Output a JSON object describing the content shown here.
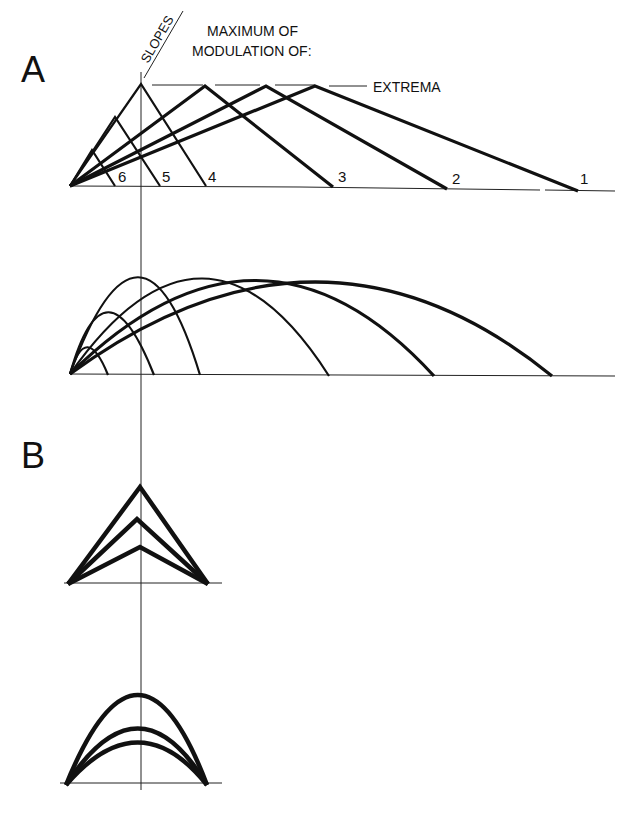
{
  "panels": {
    "a": {
      "label": "A"
    },
    "b": {
      "label": "B"
    }
  },
  "annotations": {
    "slopes": "SLOPES",
    "maximum_line1": "MAXIMUM OF",
    "maximum_line2": "MODULATION OF:",
    "extrema": "EXTREMA"
  },
  "triangle_labels": [
    "1",
    "2",
    "3",
    "4",
    "5",
    "6"
  ],
  "colors": {
    "ink": "#111111",
    "background": "#ffffff"
  }
}
